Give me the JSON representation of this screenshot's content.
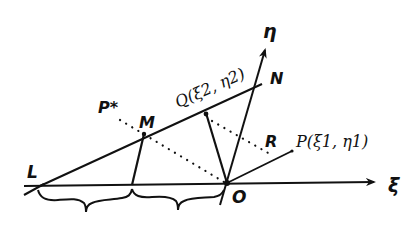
{
  "figure": {
    "colors": {
      "ink": "#111111",
      "background": "#ffffff"
    },
    "axes": {
      "xi_label": "ξ",
      "eta_label": "η",
      "origin_label": "O"
    },
    "points": {
      "L": {
        "label": "L"
      },
      "M": {
        "label": "M"
      },
      "N": {
        "label": "N"
      },
      "R": {
        "label": "R"
      },
      "P_star": {
        "label": "P*"
      },
      "Q": {
        "label": "Q(ξ2, η2)"
      },
      "P": {
        "label": "P(ξ1, η1)"
      }
    },
    "lines": [
      {
        "id": "xi-axis",
        "style": "solid",
        "arrow": true
      },
      {
        "id": "eta-axis",
        "style": "solid",
        "arrow": true
      },
      {
        "id": "line-LN",
        "style": "solid"
      },
      {
        "id": "segment-M-foot",
        "style": "solid"
      },
      {
        "id": "segment-Q-O",
        "style": "solid"
      },
      {
        "id": "segment-O-P",
        "style": "solid"
      },
      {
        "id": "dotted-Pstar-O",
        "style": "dotted"
      },
      {
        "id": "dotted-Q-R",
        "style": "dotted"
      }
    ],
    "braces": [
      {
        "id": "brace-L-foot",
        "style": "curly"
      },
      {
        "id": "brace-foot-O",
        "style": "curly"
      }
    ]
  }
}
